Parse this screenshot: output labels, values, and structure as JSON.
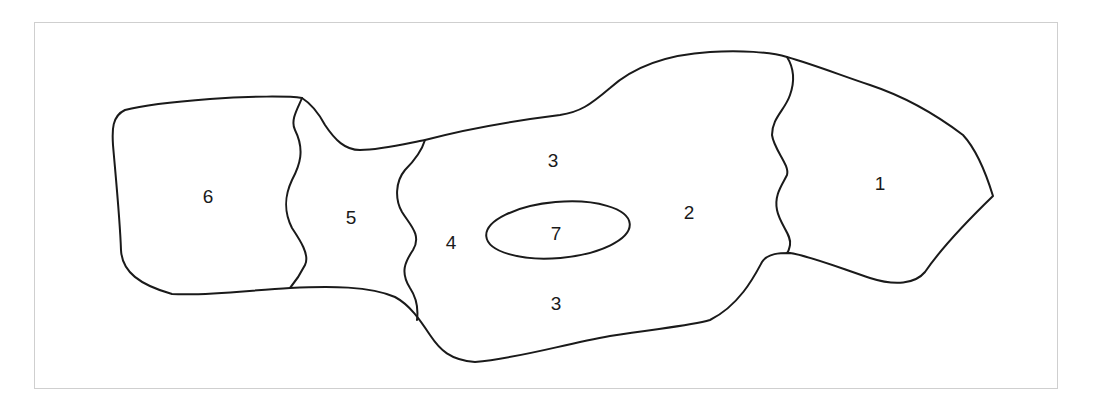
{
  "diagram": {
    "type": "region-map",
    "stroke_color": "#1a1a1a",
    "frame_border_color": "#cfcfcf",
    "regions": [
      {
        "id": "region-1",
        "label": "1",
        "x": 880,
        "y": 183
      },
      {
        "id": "region-2",
        "label": "2",
        "x": 689,
        "y": 212
      },
      {
        "id": "region-3-top",
        "label": "3",
        "x": 553,
        "y": 160
      },
      {
        "id": "region-3-bottom",
        "label": "3",
        "x": 556,
        "y": 303
      },
      {
        "id": "region-4",
        "label": "4",
        "x": 451,
        "y": 242
      },
      {
        "id": "region-5",
        "label": "5",
        "x": 351,
        "y": 217
      },
      {
        "id": "region-6",
        "label": "6",
        "x": 208,
        "y": 196
      },
      {
        "id": "region-7",
        "label": "7",
        "x": 556,
        "y": 233
      }
    ]
  }
}
